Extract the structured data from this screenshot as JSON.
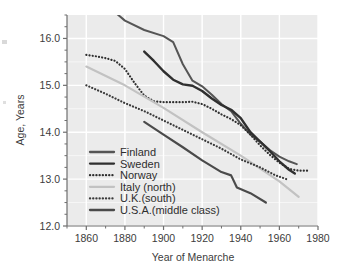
{
  "figure": {
    "background": "#ffffff",
    "plot_background": "#ebebeb",
    "gridline_color": "#ffffff",
    "axis_color": "#6e6e6e"
  },
  "chart_data": {
    "type": "line",
    "title": "",
    "xlabel": "Year of Menarche",
    "ylabel": "Age, Years",
    "xlim": [
      1850,
      1980
    ],
    "ylim": [
      12.0,
      16.5
    ],
    "xticks": [
      1860,
      1880,
      1900,
      1920,
      1940,
      1960,
      1980
    ],
    "xtick_labels": [
      "1860",
      "1880",
      "1900",
      "1920",
      "1940",
      "1960",
      "1980"
    ],
    "yticks": [
      12.0,
      13.0,
      14.0,
      15.0,
      16.0
    ],
    "ytick_labels": [
      "12.0",
      "13.0",
      "14.0",
      "15.0",
      "16.0"
    ],
    "minor_ytick_step": 0.25,
    "minor_xtick_step": 10,
    "grid": true,
    "grid_color": "#ffffff",
    "legend_position": "lower-left-inside",
    "series": [
      {
        "name": "Finland",
        "style": "solid",
        "color": "#555555",
        "width": 2.0,
        "points": [
          [
            1876,
            16.52
          ],
          [
            1880,
            16.38
          ],
          [
            1890,
            16.18
          ],
          [
            1900,
            16.05
          ],
          [
            1905,
            15.92
          ],
          [
            1910,
            15.45
          ],
          [
            1915,
            15.1
          ],
          [
            1920,
            14.98
          ],
          [
            1925,
            14.8
          ],
          [
            1930,
            14.6
          ],
          [
            1935,
            14.45
          ],
          [
            1940,
            14.18
          ],
          [
            1945,
            13.95
          ],
          [
            1950,
            13.8
          ],
          [
            1955,
            13.62
          ],
          [
            1960,
            13.48
          ],
          [
            1965,
            13.38
          ],
          [
            1969,
            13.32
          ]
        ]
      },
      {
        "name": "Sweden",
        "style": "solid",
        "color": "#2f2f2f",
        "width": 2.4,
        "points": [
          [
            1890,
            15.72
          ],
          [
            1895,
            15.52
          ],
          [
            1900,
            15.3
          ],
          [
            1905,
            15.12
          ],
          [
            1910,
            15.02
          ],
          [
            1915,
            14.99
          ],
          [
            1920,
            14.88
          ],
          [
            1925,
            14.72
          ],
          [
            1930,
            14.58
          ],
          [
            1935,
            14.48
          ],
          [
            1940,
            14.3
          ],
          [
            1945,
            14.0
          ],
          [
            1950,
            13.8
          ],
          [
            1955,
            13.6
          ],
          [
            1960,
            13.38
          ],
          [
            1965,
            13.2
          ],
          [
            1968,
            13.12
          ]
        ]
      },
      {
        "name": "Norway",
        "style": "dotted",
        "color": "#2f2f2f",
        "width": 2.2,
        "points": [
          [
            1860,
            15.65
          ],
          [
            1865,
            15.62
          ],
          [
            1870,
            15.58
          ],
          [
            1875,
            15.52
          ],
          [
            1880,
            15.35
          ],
          [
            1885,
            15.05
          ],
          [
            1890,
            14.78
          ],
          [
            1895,
            14.66
          ],
          [
            1900,
            14.64
          ],
          [
            1905,
            14.64
          ],
          [
            1910,
            14.64
          ],
          [
            1915,
            14.65
          ],
          [
            1920,
            14.6
          ],
          [
            1925,
            14.5
          ],
          [
            1930,
            14.38
          ],
          [
            1935,
            14.28
          ],
          [
            1940,
            14.15
          ],
          [
            1945,
            13.95
          ],
          [
            1950,
            13.72
          ],
          [
            1955,
            13.52
          ],
          [
            1960,
            13.35
          ],
          [
            1965,
            13.22
          ],
          [
            1970,
            13.18
          ],
          [
            1975,
            13.18
          ]
        ]
      },
      {
        "name": "Italy (north)",
        "style": "solid",
        "color": "#c2c2c2",
        "width": 2.2,
        "points": [
          [
            1860,
            15.4
          ],
          [
            1880,
            15.0
          ],
          [
            1900,
            14.52
          ],
          [
            1920,
            14.0
          ],
          [
            1940,
            13.5
          ],
          [
            1960,
            12.95
          ],
          [
            1970,
            12.62
          ]
        ]
      },
      {
        "name": "U.K.(south)",
        "style": "dotted",
        "color": "#3a3a3a",
        "width": 2.2,
        "points": [
          [
            1860,
            15.0
          ],
          [
            1870,
            14.82
          ],
          [
            1880,
            14.62
          ],
          [
            1890,
            14.45
          ],
          [
            1900,
            14.25
          ],
          [
            1910,
            14.05
          ],
          [
            1920,
            13.85
          ],
          [
            1930,
            13.65
          ],
          [
            1940,
            13.42
          ],
          [
            1950,
            13.25
          ],
          [
            1958,
            13.08
          ],
          [
            1965,
            12.98
          ]
        ]
      },
      {
        "name": "U.S.A.(middle class)",
        "style": "solid",
        "color": "#4a4a4a",
        "width": 2.2,
        "points": [
          [
            1890,
            14.22
          ],
          [
            1900,
            13.95
          ],
          [
            1910,
            13.68
          ],
          [
            1920,
            13.4
          ],
          [
            1930,
            13.15
          ],
          [
            1935,
            13.08
          ],
          [
            1938,
            12.82
          ],
          [
            1945,
            12.7
          ],
          [
            1953,
            12.5
          ]
        ]
      }
    ]
  },
  "legend": {
    "items": [
      {
        "label": "Finland",
        "style": "solid",
        "color": "#555555"
      },
      {
        "label": "Sweden",
        "style": "solid",
        "color": "#2f2f2f"
      },
      {
        "label": "Norway",
        "style": "dotted",
        "color": "#2f2f2f"
      },
      {
        "label": "Italy (north)",
        "style": "solid",
        "color": "#c2c2c2"
      },
      {
        "label": "U.K.(south)",
        "style": "dotted",
        "color": "#3a3a3a"
      },
      {
        "label": "U.S.A.(middle class)",
        "style": "solid",
        "color": "#4a4a4a"
      }
    ]
  }
}
